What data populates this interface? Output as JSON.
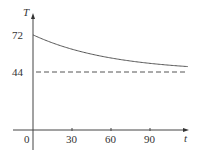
{
  "chart_data": {
    "type": "line",
    "title": "",
    "xlabel": "t",
    "ylabel": "T",
    "x_ticks": [
      "30",
      "60",
      "90"
    ],
    "origin_label": "0",
    "y_ticks": [
      "44",
      "72"
    ],
    "xlim": [
      0,
      120
    ],
    "ylim": [
      0,
      80
    ],
    "grid": false,
    "legend": null,
    "series": [
      {
        "name": "T(t)",
        "style": "solid",
        "x": [
          0,
          15,
          30,
          45,
          60,
          75,
          90,
          105,
          119
        ],
        "values": [
          72,
          66.9,
          61.1,
          57.3,
          54.2,
          51.9,
          50.4,
          49.2,
          48.0
        ]
      },
      {
        "name": "asymptote",
        "style": "dashed",
        "x": [
          0,
          119
        ],
        "values": [
          44,
          44
        ]
      }
    ],
    "annotations": []
  },
  "colors": {
    "curve": "#555555",
    "axis": "#444444",
    "dashed": "#555555"
  }
}
